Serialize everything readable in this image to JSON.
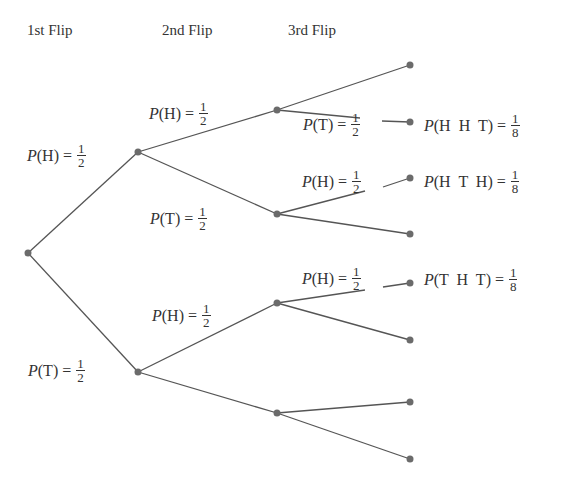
{
  "headers": {
    "first": "1st Flip",
    "second": "2nd Flip",
    "third": "3rd Flip"
  },
  "colors": {
    "line": "#555555",
    "node": "#6b6b6b",
    "text": "#333333"
  },
  "labels": {
    "l1_H": {
      "prefix": "P",
      "event": "(H) =",
      "num": "1",
      "den": "2"
    },
    "l1_T": {
      "prefix": "P",
      "event": "(T) =",
      "num": "1",
      "den": "2"
    },
    "l2_HH": {
      "prefix": "P",
      "event": "(H) =",
      "num": "1",
      "den": "2"
    },
    "l2_HT": {
      "prefix": "P",
      "event": "(T) =",
      "num": "1",
      "den": "2"
    },
    "l2_TH": {
      "prefix": "P",
      "event": "(H) =",
      "num": "1",
      "den": "2"
    },
    "l3_HHT": {
      "prefix": "P",
      "event": "(T) =",
      "num": "1",
      "den": "2"
    },
    "l3_HTH": {
      "prefix": "P",
      "event": "(H) =",
      "num": "1",
      "den": "2"
    },
    "l3_THT": {
      "prefix": "P",
      "event": "(H) =",
      "num": "1",
      "den": "2"
    }
  },
  "outcomes": {
    "HHT": {
      "prefix": "P",
      "event": "(H  H  T) =",
      "num": "1",
      "den": "8"
    },
    "HTH": {
      "prefix": "P",
      "event": "(H  T  H) =",
      "num": "1",
      "den": "8"
    },
    "THT": {
      "prefix": "P",
      "event": "(T  H  T) =",
      "num": "1",
      "den": "8"
    }
  }
}
